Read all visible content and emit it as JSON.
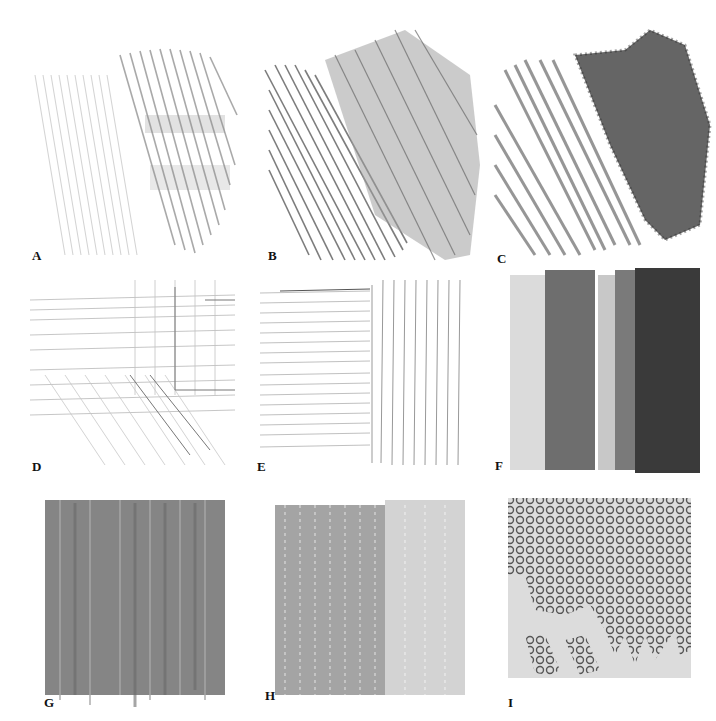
{
  "figure": {
    "panels": [
      {
        "id": "A",
        "label": "A",
        "texture": "light-hatching-diagonal",
        "tone": "#9a9a9a"
      },
      {
        "id": "B",
        "label": "B",
        "texture": "diagonal-lines-and-dense-hatching",
        "tone": "#7a7a7a"
      },
      {
        "id": "C",
        "label": "C",
        "texture": "diagonal-lines-and-stippled-dark-texture",
        "tone": "#555555"
      },
      {
        "id": "D",
        "label": "D",
        "texture": "crosshatch-grid-faint",
        "tone": "#aaaaaa"
      },
      {
        "id": "E",
        "label": "E",
        "texture": "horizontal-and-vertical-lines",
        "tone": "#999999"
      },
      {
        "id": "F",
        "label": "F",
        "texture": "graded-vertical-tone-bands",
        "tone": "#333333"
      },
      {
        "id": "G",
        "label": "G",
        "texture": "solid-vertical-strokes",
        "tone": "#777777"
      },
      {
        "id": "H",
        "label": "H",
        "texture": "grainy-vertical-strokes",
        "tone": "#666666"
      },
      {
        "id": "I",
        "label": "I",
        "texture": "looped-circle-pattern-on-grey",
        "tone": "#555555"
      }
    ]
  }
}
